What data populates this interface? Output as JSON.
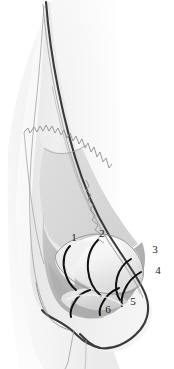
{
  "figure": {
    "view": "lateral profile",
    "background_color": "#ffffff",
    "line_color": "#2b2b2b",
    "skin_fill": "#f2f2f2",
    "shadow_fill": "#ededed",
    "ala_fill": "#b9b9b9",
    "sidewall_fill": "#d6d6d6",
    "cartilage_fill": "#f7f7f7",
    "label_color": "#1c1c1c",
    "label_font_size": "11px"
  },
  "labels": [
    {
      "id": "1",
      "text": "1",
      "x": 74,
      "y": 241,
      "leader": "segment-1-arc"
    },
    {
      "id": "2",
      "text": "2",
      "x": 102,
      "y": 237,
      "leader": "segment-2-arc"
    },
    {
      "id": "3",
      "text": "3",
      "x": 155,
      "y": 253,
      "leader": "segment-3-arc"
    },
    {
      "id": "4",
      "text": "4",
      "x": 158,
      "y": 274,
      "leader": "segment-4-arc"
    },
    {
      "id": "5",
      "text": "5",
      "x": 133,
      "y": 305,
      "leader": "segment-5-arc"
    },
    {
      "id": "6",
      "text": "6",
      "x": 108,
      "y": 313,
      "leader": "segment-6-arc"
    }
  ],
  "structures": [
    {
      "id": "skin-envelope",
      "name": "Skin soft tissue envelope"
    },
    {
      "id": "nasal-bone",
      "name": "Nasal bone"
    },
    {
      "id": "bone-cartilage-junction",
      "name": "Bony cartilaginous junction (serrated edge)"
    },
    {
      "id": "upper-lateral-cartilage",
      "name": "Upper lateral cartilage"
    },
    {
      "id": "lower-lateral-cartilage",
      "name": "Lower lateral cartilage"
    },
    {
      "id": "lateral-crus",
      "name": "Lateral crus"
    },
    {
      "id": "nasal-ala",
      "name": "Nasal ala"
    },
    {
      "id": "nasal-tip",
      "name": "Nasal tip / dome"
    },
    {
      "id": "columella",
      "name": "Columella"
    },
    {
      "id": "upper-lip",
      "name": "Upper lip"
    }
  ]
}
